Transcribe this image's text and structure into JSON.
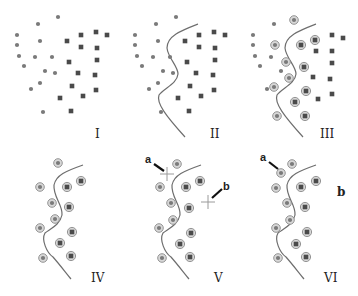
{
  "figure": {
    "colors": {
      "class_a": "#7a7a7a",
      "class_b": "#4a4a4a",
      "boundary": "#6e6e6e",
      "support_ring": "#d8d8d8",
      "arrow": "#111111"
    },
    "panels": [
      {
        "id": "I",
        "label": "I",
        "label_pos": [
          96,
          137
        ]
      },
      {
        "id": "II",
        "label": "II",
        "label_pos": [
          213,
          137
        ]
      },
      {
        "id": "III",
        "label": "III",
        "label_pos": [
          322,
          137
        ]
      },
      {
        "id": "IV",
        "label": "IV",
        "label_pos": [
          92,
          282
        ]
      },
      {
        "id": "V",
        "label": "V",
        "label_pos": [
          215,
          282
        ]
      },
      {
        "id": "VI",
        "label": "VI",
        "label_pos": [
          325,
          282
        ]
      }
    ],
    "annotations": {
      "a_label": "a",
      "b_label": "b"
    }
  },
  "points": {
    "circles": [
      [
        58,
        17
      ],
      [
        38,
        24
      ],
      [
        17,
        35
      ],
      [
        17,
        45
      ],
      [
        40,
        41
      ],
      [
        19,
        56
      ],
      [
        35,
        57
      ],
      [
        52,
        57
      ],
      [
        24,
        66
      ],
      [
        45,
        71
      ],
      [
        55,
        73
      ],
      [
        40,
        83
      ],
      [
        31,
        89
      ],
      [
        43,
        112
      ]
    ],
    "squares": [
      [
        67,
        41
      ],
      [
        81,
        35
      ],
      [
        96,
        32
      ],
      [
        107,
        35
      ],
      [
        81,
        47
      ],
      [
        97,
        48
      ],
      [
        69,
        62
      ],
      [
        97,
        60
      ],
      [
        78,
        73
      ],
      [
        95,
        75
      ],
      [
        72,
        86
      ],
      [
        96,
        90
      ],
      [
        60,
        98
      ],
      [
        83,
        96
      ],
      [
        71,
        111
      ]
    ],
    "support_circles": [
      [
        58,
        17
      ],
      [
        40,
        41
      ],
      [
        52,
        57
      ],
      [
        55,
        73
      ],
      [
        40,
        83
      ],
      [
        43,
        112
      ]
    ],
    "support_squares": [
      [
        81,
        35
      ],
      [
        67,
        41
      ],
      [
        69,
        62
      ],
      [
        72,
        86
      ],
      [
        60,
        98
      ],
      [
        71,
        111
      ]
    ]
  }
}
